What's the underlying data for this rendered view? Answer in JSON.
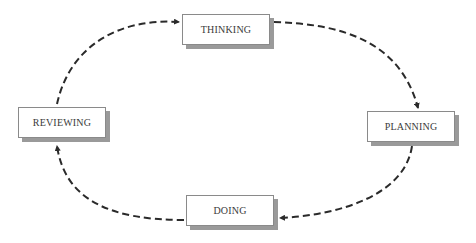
{
  "diagram": {
    "type": "cycle",
    "nodes": [
      {
        "id": "thinking",
        "label": "THINKING"
      },
      {
        "id": "planning",
        "label": "PLANNING"
      },
      {
        "id": "doing",
        "label": "DOING"
      },
      {
        "id": "reviewing",
        "label": "REVIEWING"
      }
    ],
    "edges": [
      {
        "from": "thinking",
        "to": "planning",
        "style": "dashed"
      },
      {
        "from": "planning",
        "to": "doing",
        "style": "dashed"
      },
      {
        "from": "doing",
        "to": "reviewing",
        "style": "dashed"
      },
      {
        "from": "reviewing",
        "to": "thinking",
        "style": "dashed"
      }
    ],
    "colors": {
      "line": "#2a2a2a",
      "border": "#8a8a8a",
      "shadow": "#9a9a9a",
      "text": "#3a3a3a"
    }
  }
}
